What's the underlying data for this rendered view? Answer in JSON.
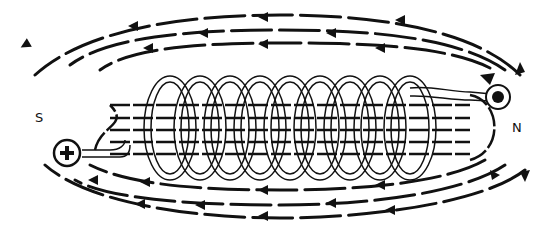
{
  "diagram": {
    "poles": {
      "south": "S",
      "north": "N"
    },
    "terminals": {
      "positive": "+",
      "negative": "•"
    },
    "coil_turns": 9,
    "field_direction": "arrows point left outside the coil, right inside the coil",
    "colors": {
      "ink": "#111111",
      "background": "#ffffff",
      "coil_fill": "#ffffff"
    }
  }
}
